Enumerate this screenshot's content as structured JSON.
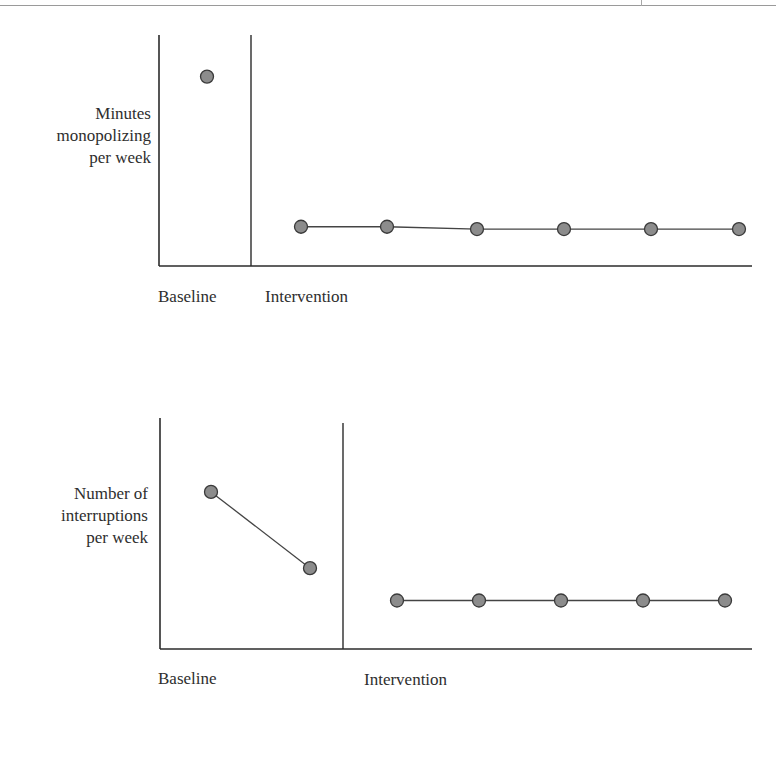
{
  "page": {
    "header_rule": true
  },
  "charts": [
    {
      "ylabel_lines": [
        "Minutes",
        "monopolizing",
        "per week"
      ],
      "phase_labels": [
        "Baseline",
        "Intervention"
      ]
    },
    {
      "ylabel_lines": [
        "Number of",
        "interruptions",
        "per week"
      ],
      "phase_labels": [
        "Baseline",
        "Intervention"
      ]
    }
  ],
  "colors": {
    "axis": "#2b2b2b",
    "marker_fill": "#8c8c8c",
    "marker_stroke": "#3a3a3a",
    "line": "#444444"
  },
  "chart_data": [
    {
      "type": "line",
      "title": "",
      "xlabel": "",
      "ylabel": "Minutes monopolizing per week",
      "phases": [
        {
          "name": "Baseline",
          "x": [
            1
          ],
          "values": [
            0.82
          ]
        },
        {
          "name": "Intervention",
          "x": [
            2,
            3,
            4,
            5,
            6,
            7
          ],
          "values": [
            0.17,
            0.17,
            0.16,
            0.16,
            0.16,
            0.16
          ]
        }
      ],
      "ylim": [
        0,
        1
      ],
      "grid": false,
      "legend": "none",
      "notes": "AB single-subject design; vertical line separates Baseline from Intervention phase; no numeric tick labels shown (values are relative, estimated from pixel positions)"
    },
    {
      "type": "line",
      "title": "",
      "xlabel": "",
      "ylabel": "Number of interruptions per week",
      "phases": [
        {
          "name": "Baseline",
          "x": [
            1,
            2
          ],
          "values": [
            0.68,
            0.35
          ]
        },
        {
          "name": "Intervention",
          "x": [
            3,
            4,
            5,
            6,
            7
          ],
          "values": [
            0.21,
            0.21,
            0.21,
            0.21,
            0.21
          ]
        }
      ],
      "ylim": [
        0,
        1
      ],
      "grid": false,
      "legend": "none",
      "notes": "AB single-subject design; vertical line separates Baseline from Intervention phase; no numeric tick labels shown (values are relative, estimated from pixel positions)"
    }
  ]
}
